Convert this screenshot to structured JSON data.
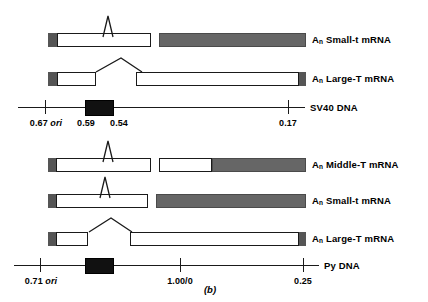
{
  "figure": {
    "caption": "(b)",
    "width": 428,
    "height": 302,
    "colors": {
      "exon_untranslated": "#ffffff",
      "exon_coding": "#666666",
      "cap_segment": "#555555",
      "origin_box": "#111111",
      "line": "#1a1a1a",
      "text": "#000000"
    }
  },
  "groups": [
    {
      "name": "sv40",
      "dna_label": "SV40 DNA",
      "transcripts": [
        {
          "label_an": "A",
          "label_sub": "n",
          "label_text": "Small-t mRNA"
        },
        {
          "label_an": "A",
          "label_sub": "n",
          "label_text": "Large-T mRNA"
        }
      ],
      "coordinates": [
        {
          "value": "0.67",
          "ori": "ori"
        },
        {
          "value": "0.59",
          "ori": ""
        },
        {
          "value": "0.54",
          "ori": ""
        },
        {
          "value": "0.17",
          "ori": ""
        }
      ]
    },
    {
      "name": "py",
      "dna_label": "Py DNA",
      "transcripts": [
        {
          "label_an": "A",
          "label_sub": "n",
          "label_text": "Middle-T mRNA"
        },
        {
          "label_an": "A",
          "label_sub": "n",
          "label_text": "Small-t mRNA"
        },
        {
          "label_an": "A",
          "label_sub": "n",
          "label_text": "Large-T mRNA"
        }
      ],
      "coordinates": [
        {
          "value": "0.71",
          "ori": "ori"
        },
        {
          "value": "1.00/0",
          "ori": ""
        },
        {
          "value": "0.25",
          "ori": ""
        }
      ]
    }
  ]
}
